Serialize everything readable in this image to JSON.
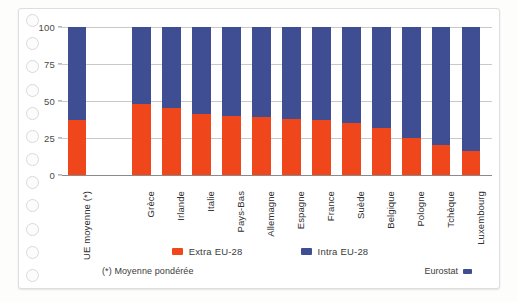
{
  "chart_data": {
    "type": "bar",
    "subtype": "stacked-100-percent",
    "title": "",
    "xlabel": "",
    "ylabel": "",
    "ylim": [
      0,
      100
    ],
    "yticks": [
      0,
      25,
      50,
      75,
      100
    ],
    "grid": true,
    "legend_position": "bottom",
    "categories": [
      "UE moyenne (*)",
      "Grèce",
      "Irlande",
      "Italie",
      "Pays-Bas",
      "Allemagne",
      "Espagne",
      "France",
      "Suède",
      "Belgique",
      "Pologne",
      "Tchèque",
      "Luxembourg"
    ],
    "category_gap_after_index": 0,
    "series": [
      {
        "name": "Extra EU-28",
        "color": "#f0461c",
        "values": [
          37,
          48,
          45,
          41,
          40,
          39,
          38,
          37,
          35,
          32,
          25,
          20,
          16
        ]
      },
      {
        "name": "Intra EU-28",
        "color": "#3f4d92",
        "values": [
          63,
          52,
          55,
          59,
          60,
          61,
          62,
          63,
          65,
          68,
          75,
          80,
          84
        ]
      }
    ]
  },
  "legend": {
    "items": [
      {
        "label": "Extra EU-28",
        "color": "#f0461c"
      },
      {
        "label": "Intra EU-28",
        "color": "#3f4d92"
      }
    ]
  },
  "footnote": "(*) Moyenne pondérée",
  "source": {
    "label": "Eurostat",
    "color": "#3f4d92"
  },
  "binding": {
    "hole_count": 12
  }
}
